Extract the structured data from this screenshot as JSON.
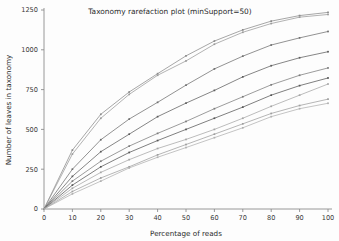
{
  "chart_data": {
    "type": "line",
    "title": "Taxonomy rarefaction plot (minSupport=50)",
    "xlabel": "Percentage of reads",
    "ylabel": "Number of leaves in taxonomy",
    "xlim": [
      0,
      100
    ],
    "ylim": [
      0,
      1250
    ],
    "xticks": [
      0,
      10,
      20,
      30,
      40,
      50,
      60,
      70,
      80,
      90,
      100
    ],
    "yticks": [
      0,
      250,
      500,
      750,
      1000,
      1250
    ],
    "grid": false,
    "legend": "none",
    "x": [
      0,
      10,
      20,
      30,
      40,
      50,
      60,
      70,
      80,
      90,
      100
    ],
    "series": [
      {
        "name": "sample-1",
        "color": "#8a8a8a",
        "values": [
          0,
          370,
          595,
          735,
          850,
          962,
          1055,
          1125,
          1180,
          1215,
          1235
        ]
      },
      {
        "name": "sample-2",
        "color": "#9a9a9a",
        "values": [
          0,
          345,
          570,
          720,
          840,
          930,
          1035,
          1110,
          1165,
          1205,
          1222
        ]
      },
      {
        "name": "sample-3",
        "color": "#6f6f6f",
        "values": [
          0,
          250,
          435,
          565,
          670,
          778,
          880,
          960,
          1030,
          1075,
          1115
        ]
      },
      {
        "name": "sample-4",
        "color": "#5d5d5d",
        "values": [
          0,
          205,
          360,
          470,
          580,
          665,
          745,
          830,
          900,
          950,
          988
        ]
      },
      {
        "name": "sample-5",
        "color": "#7b7b7b",
        "values": [
          0,
          175,
          300,
          395,
          475,
          550,
          630,
          705,
          780,
          840,
          886
        ]
      },
      {
        "name": "sample-6",
        "color": "#565656",
        "values": [
          0,
          150,
          265,
          355,
          430,
          500,
          570,
          640,
          715,
          775,
          823
        ]
      },
      {
        "name": "sample-7",
        "color": "#a5a5a5",
        "values": [
          0,
          130,
          230,
          310,
          380,
          437,
          500,
          570,
          645,
          715,
          785
        ]
      },
      {
        "name": "sample-8",
        "color": "#9e9e9e",
        "values": [
          0,
          110,
          195,
          265,
          340,
          405,
          470,
          535,
          600,
          650,
          690
        ]
      },
      {
        "name": "sample-9",
        "color": "#b0b0b0",
        "values": [
          0,
          95,
          175,
          258,
          325,
          386,
          448,
          510,
          580,
          630,
          664
        ]
      }
    ]
  }
}
